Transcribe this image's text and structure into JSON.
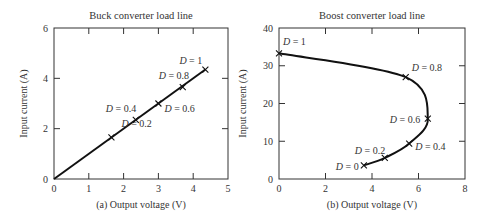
{
  "chart_data": [
    {
      "type": "line",
      "title": "Buck converter load line",
      "xlabel": "(a) Output voltage (V)",
      "ylabel": "Input current (A)",
      "xlim": [
        0,
        5
      ],
      "ylim": [
        0,
        6
      ],
      "xticks": [
        0,
        1,
        2,
        3,
        4,
        5
      ],
      "yticks": [
        0,
        2,
        4,
        6
      ],
      "grid": false,
      "series": [
        {
          "name": "load line",
          "x": [
            0,
            4.35
          ],
          "y": [
            0,
            4.35
          ]
        }
      ],
      "markers": [
        {
          "label": "D = 0.2",
          "x": 1.65,
          "y": 1.65
        },
        {
          "label": "D = 0.4",
          "x": 2.35,
          "y": 2.35
        },
        {
          "label": "D = 0.6",
          "x": 3.0,
          "y": 3.0
        },
        {
          "label": "D = 0.8",
          "x": 3.7,
          "y": 3.65
        },
        {
          "label": "D = 1",
          "x": 4.35,
          "y": 4.35
        }
      ]
    },
    {
      "type": "line",
      "title": "Boost converter load line",
      "xlabel": "(b) Output voltage (V)",
      "ylabel": "Input current (A)",
      "xlim": [
        0,
        8
      ],
      "ylim": [
        0,
        40
      ],
      "xticks": [
        0,
        2,
        4,
        6,
        8
      ],
      "yticks": [
        0,
        10,
        20,
        30,
        40
      ],
      "grid": false,
      "series": [
        {
          "name": "load line",
          "x": [
            3.65,
            4.55,
            5.6,
            6.4,
            5.45,
            0
          ],
          "y": [
            3.6,
            5.6,
            9.4,
            16,
            27,
            33.3
          ]
        }
      ],
      "markers": [
        {
          "label": "D = 0",
          "x": 3.65,
          "y": 3.6
        },
        {
          "label": "D = 0.2",
          "x": 4.55,
          "y": 5.6
        },
        {
          "label": "D = 0.4",
          "x": 5.6,
          "y": 9.4
        },
        {
          "label": "D = 0.6",
          "x": 6.4,
          "y": 16
        },
        {
          "label": "D = 0.8",
          "x": 5.45,
          "y": 27
        },
        {
          "label": "D = 1",
          "x": 0,
          "y": 33.3
        }
      ]
    }
  ]
}
